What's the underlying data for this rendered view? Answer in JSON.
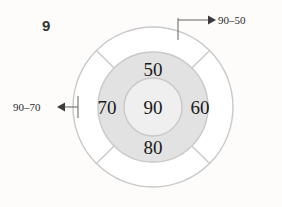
{
  "worksheet": {
    "problem_number": "9",
    "background_color": "#fdfcfa"
  },
  "diagram": {
    "kind": "concentric-circle-number-wheel",
    "center": {
      "x": 153,
      "y": 107
    },
    "radii": {
      "outer": 80,
      "middle": 55,
      "inner": 29
    },
    "colors": {
      "outer_fill": "#ffffff",
      "middle_fill": "#e2e2e2",
      "inner_fill": "#efefef",
      "stroke": "#c9c9c9",
      "number_color": "#1a1a1a",
      "leader_color": "#6f6f6f"
    },
    "spoke_angles_deg": [
      45,
      135,
      225,
      315
    ],
    "cells": {
      "center": "90",
      "top": "50",
      "right": "60",
      "bottom": "80",
      "left": "70"
    }
  },
  "annotations": {
    "top_right": {
      "label": "90‒50",
      "arrow_direction": "right"
    },
    "left": {
      "label": "90‒70",
      "arrow_direction": "left"
    }
  }
}
